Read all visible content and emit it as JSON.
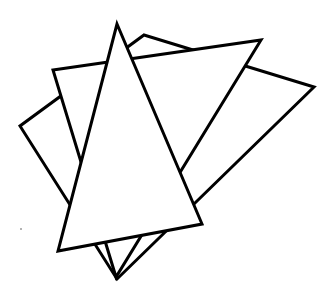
{
  "figure": {
    "stroke_color": "#000000",
    "fill_color": "#ffffff",
    "background": "#ffffff",
    "shapes": [
      {
        "name": "back-triangle",
        "points": "144,35 314,87 117,279 20,126"
      },
      {
        "name": "middle-triangle",
        "points": "53,70 261,40 116,277"
      },
      {
        "name": "front-triangle",
        "points": "117,24 202,224 58,251"
      }
    ],
    "speck": {
      "cx": 21,
      "cy": 229,
      "r": 1
    }
  }
}
